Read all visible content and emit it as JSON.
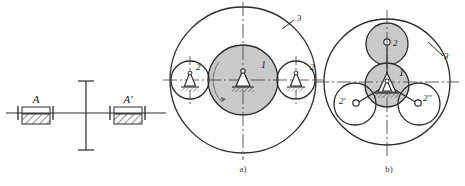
{
  "figure": {
    "title_caption_a": "a)",
    "title_caption_b": "b)",
    "colors": {
      "line": "#2b2b2b",
      "thin_line": "#555555",
      "centerline": "#4a4a4a",
      "shaded_fill": "#c9c9c9",
      "hatch": "#333333",
      "label_text": "#1a1a1a",
      "caption_text": "#3a3a3a",
      "background": "#ffffff"
    }
  },
  "left_diagram": {
    "name": "shaft-support-elevation",
    "labels": {
      "bearing_left": "A",
      "bearing_right": "A'"
    }
  },
  "diagram_a": {
    "name": "planetary-two-roller-arrangement",
    "caption": "a)",
    "labels": {
      "center_gear": "1",
      "roller_left": "2",
      "roller_right": "2",
      "outer_ring": "3"
    }
  },
  "diagram_b": {
    "name": "planetary-three-roller-arrangement",
    "caption": "b)",
    "labels": {
      "center_gear": "1",
      "roller_top": "2",
      "roller_lower_left": "2'",
      "roller_lower_right": "2''",
      "outer_ring": "3"
    }
  }
}
